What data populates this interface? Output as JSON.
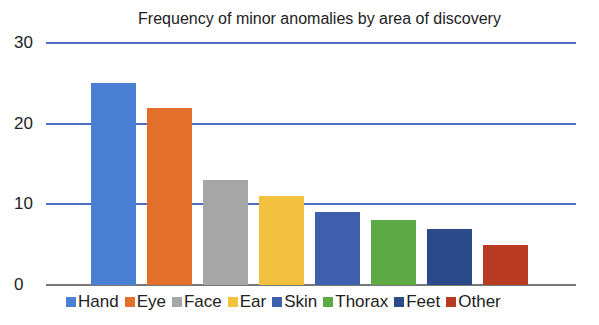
{
  "chart_data": {
    "type": "bar",
    "title": "Frequency of minor anomalies by area of discovery",
    "xlabel": "",
    "ylabel": "",
    "ylim": [
      0,
      30
    ],
    "yticks": [
      0,
      10,
      20,
      30
    ],
    "grid": true,
    "legend_position": "bottom",
    "categories": [
      "Hand",
      "Eye",
      "Face",
      "Ear",
      "Skin",
      "Thorax",
      "Feet",
      "Other"
    ],
    "values": [
      25,
      22,
      13,
      11,
      9,
      8,
      7,
      5
    ],
    "colors": [
      "#4a7fd4",
      "#e2702a",
      "#a6a6a6",
      "#f2c13e",
      "#3e5fad",
      "#5daa45",
      "#2a4a8a",
      "#b93a22"
    ]
  }
}
